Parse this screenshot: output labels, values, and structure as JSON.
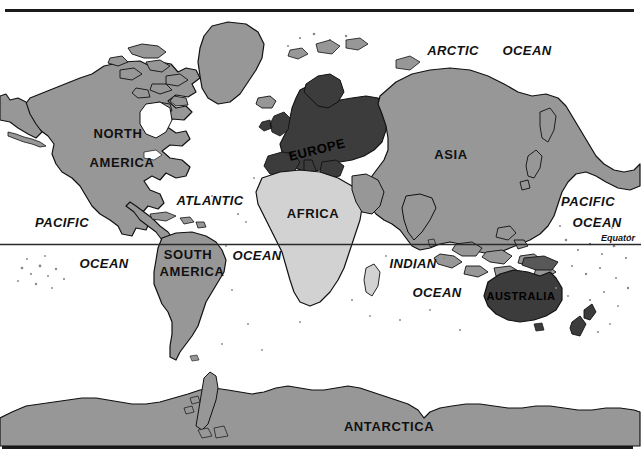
{
  "map": {
    "title": "World Map",
    "projection_note": "equirectangular world map, equator marked",
    "frame": {
      "border_color": "#1b1b1b",
      "background_color": "#ffffff"
    },
    "colors": {
      "ocean": "#ffffff",
      "land_medium_gray": "#979797",
      "land_light_gray": "#d2d2d2",
      "land_dark_gray": "#3c3c3c",
      "land_mid_dark_gray": "#585858",
      "outline": "#111111",
      "label_text": "#111111",
      "equator_line": "#2a2a2a"
    },
    "continent_labels": [
      {
        "id": "north-america",
        "text_line1": "NORTH",
        "text_line2": "AMERICA",
        "x": 118,
        "y": 138,
        "shade": "medium"
      },
      {
        "id": "south-america",
        "text_line1": "SOUTH",
        "text_line2": "AMERICA",
        "x": 188,
        "y": 258,
        "shade": "medium"
      },
      {
        "id": "europe",
        "text_line1": "EUROPE",
        "text_line2": "",
        "x": 318,
        "y": 152,
        "shade": "dark"
      },
      {
        "id": "africa",
        "text_line1": "AFRICA",
        "text_line2": "",
        "x": 313,
        "y": 214,
        "shade": "light"
      },
      {
        "id": "asia",
        "text_line1": "ASIA",
        "text_line2": "",
        "x": 451,
        "y": 155,
        "shade": "medium"
      },
      {
        "id": "australia",
        "text_line1": "AUSTRALIA",
        "text_line2": "",
        "x": 518,
        "y": 296,
        "shade": "dark"
      },
      {
        "id": "antarctica",
        "text_line1": "ANTARCTICA",
        "text_line2": "",
        "x": 389,
        "y": 427,
        "shade": "medium"
      }
    ],
    "ocean_labels": [
      {
        "id": "arctic-ocean",
        "word1": "ARCTIC",
        "word2": "OCEAN",
        "x1": 453,
        "y1": 55,
        "x2": 527,
        "y2": 55
      },
      {
        "id": "atlantic-ocean",
        "word1": "ATLANTIC",
        "word2": "OCEAN",
        "x1": 180,
        "y1": 205,
        "x2": 237,
        "y2": 260
      },
      {
        "id": "pacific-ocean-west",
        "word1": "PACIFIC",
        "word2": "OCEAN",
        "x1": 34,
        "y1": 227,
        "x2": 81,
        "y2": 266
      },
      {
        "id": "pacific-ocean-east",
        "word1": "PACIFIC",
        "word2": "OCEAN",
        "x1": 578,
        "y1": 205,
        "x2": 578,
        "y2": 226
      },
      {
        "id": "indian-ocean",
        "word1": "INDIAN",
        "word2": "OCEAN",
        "x1": 399,
        "y1": 266,
        "x2": 421,
        "y2": 294
      }
    ],
    "equator": {
      "label": "Equator",
      "label_x": 589,
      "label_y": 240,
      "line_y": 244.5
    }
  }
}
